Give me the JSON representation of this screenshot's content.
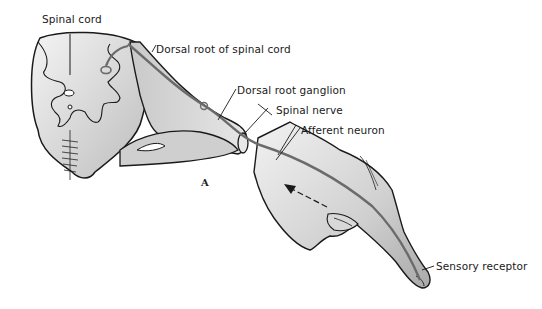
{
  "figure": {
    "panel_letter": "A",
    "labels": {
      "spinal_cord": "Spinal cord",
      "dorsal_root": "Dorsal root of spinal cord",
      "dorsal_root_ganglion": "Dorsal root ganglion",
      "spinal_nerve": "Spinal nerve",
      "afferent_neuron": "Afferent neuron",
      "sensory_receptor": "Sensory receptor"
    },
    "colors": {
      "outline": "#1a1a1a",
      "tissue_fill": "#d8d8d8",
      "tissue_light": "#efefef",
      "nerve_fiber": "#6b6b6b",
      "background": "#ffffff"
    }
  }
}
